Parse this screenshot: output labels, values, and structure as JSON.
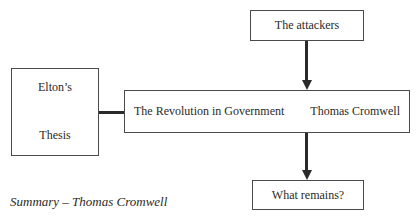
{
  "diagram": {
    "nodes": {
      "thesis": {
        "line1": "Elton’s",
        "line2": "Thesis"
      },
      "revolution": {
        "title": "The Revolution in Government",
        "subtitle": "Thomas Cromwell"
      },
      "attackers": {
        "label": "The attackers"
      },
      "remains": {
        "label": "What remains?"
      }
    },
    "edges": [
      {
        "from": "thesis",
        "to": "revolution",
        "type": "line"
      },
      {
        "from": "attackers",
        "to": "revolution",
        "type": "arrow"
      },
      {
        "from": "revolution",
        "to": "remains",
        "type": "arrow"
      }
    ]
  },
  "caption": "Summary – Thomas Cromwell"
}
